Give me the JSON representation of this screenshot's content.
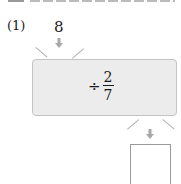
{
  "problem": {
    "number_label": "(1)",
    "input_value": "8",
    "operation": {
      "operator": "÷",
      "fraction": {
        "numerator": "2",
        "denominator": "7"
      }
    },
    "answer_value": ""
  },
  "colors": {
    "box_fill": "#ececec",
    "box_border": "#c4c4c4",
    "arrow": "#a8a8a8",
    "ray": "#b0b0b0",
    "text": "#1a1a1a"
  }
}
